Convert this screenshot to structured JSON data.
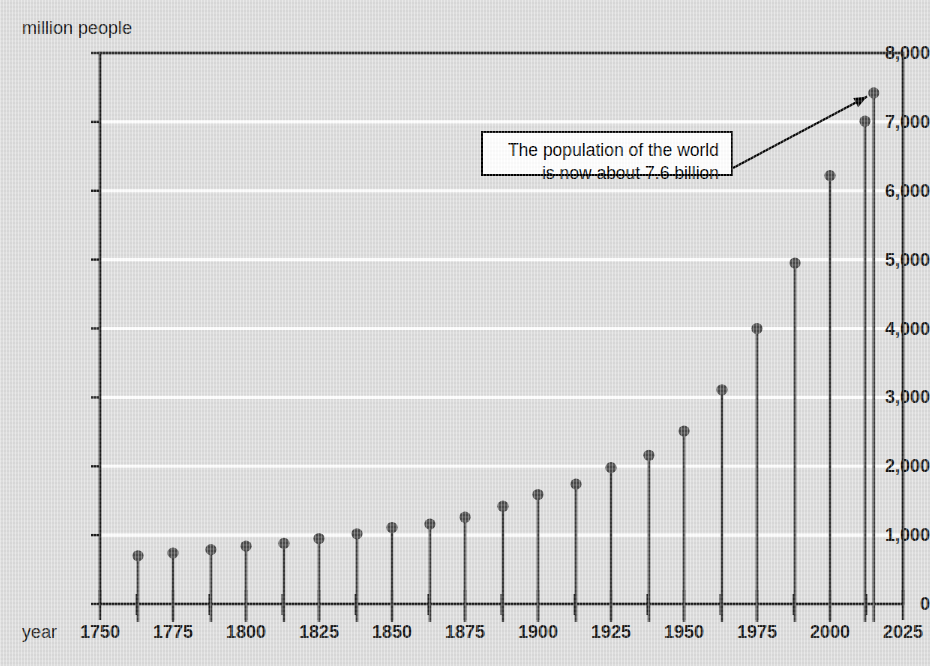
{
  "chart_data": {
    "type": "scatter",
    "title": "",
    "subtitle": "",
    "ylabel": "million people",
    "xlabel": "year",
    "ylim": [
      0,
      8000
    ],
    "xlim": [
      1750,
      2025
    ],
    "grid": true,
    "legend": "none",
    "y_ticks": [
      0,
      1000,
      2000,
      3000,
      4000,
      5000,
      6000,
      7000,
      8000
    ],
    "y_tick_labels": [
      "0",
      "1,000",
      "2,000",
      "3,000",
      "4,000",
      "5,000",
      "6,000",
      "7,000",
      "8,000"
    ],
    "x_ticks": [
      1750,
      1775,
      1800,
      1825,
      1850,
      1875,
      1900,
      1925,
      1950,
      1975,
      2000,
      2025
    ],
    "x_tick_labels": [
      "1750",
      "1775",
      "1800",
      "1825",
      "1850",
      "1875",
      "1900",
      "1925",
      "1950",
      "1975",
      "2000",
      "2025"
    ],
    "x_minor_tick_step": 12.5,
    "marker_style": "lollipop",
    "x": [
      1763,
      1775,
      1788,
      1800,
      1813,
      1825,
      1838,
      1850,
      1863,
      1875,
      1888,
      1900,
      1913,
      1925,
      1938,
      1950,
      1963,
      1975,
      1988,
      2000,
      2012,
      2015
    ],
    "values": [
      700,
      740,
      790,
      840,
      880,
      950,
      1020,
      1110,
      1160,
      1260,
      1420,
      1590,
      1740,
      1980,
      2160,
      2510,
      3110,
      4000,
      4950,
      6220,
      7010,
      7420
    ],
    "annotations": [
      {
        "text_lines": [
          "The population of the world",
          "is now about 7.6 billion"
        ],
        "points_to_x": 2015,
        "points_to_y": 7420
      }
    ]
  },
  "colors": {
    "background": "#dcdcdc",
    "gridline": "#ffffff",
    "axis": "#1a1a1a",
    "marker": "#4a4a4a",
    "stem": "#3a3a3a",
    "text": "#141414",
    "annotation_bg": "#ffffff",
    "annotation_border": "#000000"
  }
}
